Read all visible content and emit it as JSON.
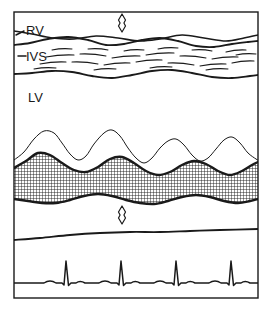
{
  "figure": {
    "name": "m-mode-echocardiogram-diagram",
    "type": "line-drawing",
    "background_color": "#ffffff",
    "stroke_color": "#1a1a1a",
    "frame": {
      "x": 14,
      "y": 12,
      "width": 244,
      "height": 286,
      "stroke_width": 1.4
    }
  },
  "labels": {
    "rv": "RV",
    "ivs": "IVS",
    "lv": "LV"
  },
  "label_positions": {
    "rv": {
      "x": 26,
      "y": 35
    },
    "ivs": {
      "x": 26,
      "y": 61
    },
    "lv": {
      "x": 28,
      "y": 102
    }
  },
  "label_ticks": {
    "rv_tick": {
      "x1": 16,
      "y1": 35,
      "x2": 24,
      "y2": 31
    },
    "ivs_tick": {
      "x1": 18,
      "y1": 56,
      "x2": 26,
      "y2": 56
    }
  },
  "markers": {
    "top_caliper": {
      "name": "rv-cavity-caliper",
      "cx": 122,
      "cy": 23,
      "height": 18,
      "width": 7
    },
    "bottom_caliper": {
      "name": "posterior-wall-caliper",
      "cx": 122,
      "cy": 215,
      "height": 18,
      "width": 7
    }
  },
  "chart_data": {
    "type": "line",
    "xlabel": "",
    "ylabel": "",
    "grid": false,
    "legend": "none",
    "xlim": [
      14,
      258
    ],
    "ylim": [
      12,
      298
    ],
    "annotations": [
      "RV",
      "IVS",
      "LV"
    ],
    "series": [
      {
        "name": "rv-anterior-wall",
        "stroke_width": 1.6,
        "points": [
          [
            14,
            31
          ],
          [
            32,
            34
          ],
          [
            52,
            38
          ],
          [
            74,
            39
          ],
          [
            96,
            36
          ],
          [
            118,
            38
          ],
          [
            140,
            41
          ],
          [
            160,
            39
          ],
          [
            182,
            35
          ],
          [
            204,
            38
          ],
          [
            226,
            41
          ],
          [
            244,
            38
          ],
          [
            258,
            35
          ]
        ]
      },
      {
        "name": "rv-endocardium-septum-top",
        "stroke_width": 1.8,
        "points": [
          [
            14,
            45
          ],
          [
            30,
            43
          ],
          [
            48,
            39
          ],
          [
            68,
            37
          ],
          [
            88,
            40
          ],
          [
            106,
            45
          ],
          [
            124,
            44
          ],
          [
            142,
            40
          ],
          [
            160,
            38
          ],
          [
            178,
            41
          ],
          [
            196,
            46
          ],
          [
            214,
            47
          ],
          [
            232,
            44
          ],
          [
            248,
            42
          ],
          [
            258,
            41
          ]
        ]
      },
      {
        "name": "ivs-lower-border",
        "stroke_width": 1.8,
        "points": [
          [
            14,
            74
          ],
          [
            32,
            73
          ],
          [
            52,
            71
          ],
          [
            72,
            72
          ],
          [
            92,
            76
          ],
          [
            112,
            78
          ],
          [
            132,
            75
          ],
          [
            152,
            71
          ],
          [
            172,
            70
          ],
          [
            192,
            73
          ],
          [
            212,
            77
          ],
          [
            232,
            78
          ],
          [
            250,
            76
          ],
          [
            258,
            75
          ]
        ]
      },
      {
        "name": "lv-endocardium-thin",
        "stroke_width": 1.0,
        "peaks": 4,
        "points": [
          [
            14,
            160
          ],
          [
            24,
            152
          ],
          [
            34,
            139
          ],
          [
            44,
            131
          ],
          [
            54,
            133
          ],
          [
            62,
            143
          ],
          [
            70,
            154
          ],
          [
            78,
            160
          ],
          [
            86,
            156
          ],
          [
            94,
            144
          ],
          [
            104,
            133
          ],
          [
            112,
            130
          ],
          [
            120,
            136
          ],
          [
            128,
            148
          ],
          [
            136,
            158
          ],
          [
            144,
            163
          ],
          [
            152,
            158
          ],
          [
            160,
            148
          ],
          [
            168,
            141
          ],
          [
            176,
            139
          ],
          [
            184,
            145
          ],
          [
            192,
            155
          ],
          [
            200,
            161
          ],
          [
            208,
            158
          ],
          [
            216,
            149
          ],
          [
            224,
            140
          ],
          [
            232,
            137
          ],
          [
            240,
            143
          ],
          [
            248,
            153
          ],
          [
            256,
            159
          ],
          [
            258,
            160
          ]
        ]
      },
      {
        "name": "posterior-wall-upper-border",
        "stroke_width": 2.4,
        "points": [
          [
            14,
            168
          ],
          [
            26,
            161
          ],
          [
            38,
            153
          ],
          [
            50,
            155
          ],
          [
            62,
            163
          ],
          [
            74,
            170
          ],
          [
            86,
            172
          ],
          [
            98,
            167
          ],
          [
            110,
            159
          ],
          [
            122,
            157
          ],
          [
            134,
            163
          ],
          [
            146,
            171
          ],
          [
            158,
            175
          ],
          [
            170,
            172
          ],
          [
            182,
            165
          ],
          [
            194,
            161
          ],
          [
            206,
            164
          ],
          [
            218,
            171
          ],
          [
            230,
            175
          ],
          [
            242,
            171
          ],
          [
            252,
            165
          ],
          [
            258,
            162
          ]
        ]
      },
      {
        "name": "posterior-wall-lower-border",
        "stroke_width": 2.4,
        "points": [
          [
            14,
            199
          ],
          [
            28,
            201
          ],
          [
            42,
            203
          ],
          [
            56,
            203
          ],
          [
            70,
            200
          ],
          [
            84,
            196
          ],
          [
            98,
            194
          ],
          [
            112,
            196
          ],
          [
            126,
            200
          ],
          [
            140,
            203
          ],
          [
            154,
            204
          ],
          [
            168,
            201
          ],
          [
            182,
            197
          ],
          [
            196,
            195
          ],
          [
            210,
            197
          ],
          [
            224,
            201
          ],
          [
            238,
            203
          ],
          [
            250,
            201
          ],
          [
            258,
            199
          ]
        ]
      },
      {
        "name": "pericardium-line",
        "stroke_width": 1.8,
        "points": [
          [
            14,
            240
          ],
          [
            40,
            238
          ],
          [
            70,
            235
          ],
          [
            100,
            233
          ],
          [
            130,
            232
          ],
          [
            160,
            232
          ],
          [
            190,
            231
          ],
          [
            220,
            230
          ],
          [
            258,
            229
          ]
        ]
      }
    ],
    "stipple_band": {
      "name": "posterior-wall-stipple",
      "pattern": "cross-hatch",
      "pattern_spacing_px": 3,
      "between": [
        "posterior-wall-upper-border",
        "posterior-wall-lower-border"
      ]
    },
    "septum_texture": {
      "name": "ivs-speckle-dashes",
      "count": 24,
      "dashes": [
        [
          46,
          57,
          74,
          55
        ],
        [
          80,
          54,
          106,
          56
        ],
        [
          112,
          58,
          140,
          56
        ],
        [
          146,
          55,
          174,
          53
        ],
        [
          180,
          56,
          206,
          58
        ],
        [
          212,
          59,
          238,
          57
        ],
        [
          40,
          64,
          66,
          62
        ],
        [
          72,
          62,
          98,
          64
        ],
        [
          104,
          65,
          130,
          63
        ],
        [
          136,
          62,
          162,
          60
        ],
        [
          168,
          63,
          194,
          65
        ],
        [
          200,
          66,
          226,
          64
        ],
        [
          232,
          63,
          254,
          61
        ],
        [
          52,
          50,
          72,
          49
        ],
        [
          88,
          49,
          108,
          50
        ],
        [
          124,
          51,
          144,
          50
        ],
        [
          158,
          49,
          178,
          48
        ],
        [
          192,
          50,
          212,
          51
        ],
        [
          226,
          52,
          246,
          50
        ],
        [
          34,
          69,
          56,
          68
        ],
        [
          94,
          70,
          116,
          69
        ],
        [
          150,
          68,
          172,
          67
        ],
        [
          206,
          70,
          228,
          69
        ],
        [
          236,
          55,
          256,
          54
        ]
      ]
    },
    "ecg": {
      "name": "ecg-trace",
      "stroke_width": 1.5,
      "baseline_y": 283,
      "beats": 4,
      "qrs_x": [
        66,
        121,
        176,
        231
      ],
      "qrs_amplitude_px": 22,
      "p_wave_amplitude_px": 4,
      "p_wave_offset_px": -16,
      "t_wave_amplitude_px": 3,
      "t_wave_offset_px": 14
    }
  }
}
